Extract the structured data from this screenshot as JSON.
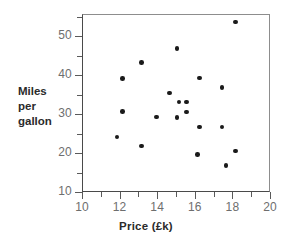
{
  "chart_data": {
    "type": "scatter",
    "title": "",
    "xlabel": "Price (£k)",
    "ylabel_lines": [
      "Miles",
      "per",
      "gallon"
    ],
    "ylabel": "Miles per gallon",
    "xlim": [
      10,
      20
    ],
    "ylim": [
      10,
      55
    ],
    "grid": false,
    "legend": null,
    "x_major_ticks": [
      10,
      12,
      14,
      16,
      18,
      20
    ],
    "x_minor_ticks": [
      11,
      13,
      15,
      17,
      19
    ],
    "x_tick_labels": [
      "10",
      "12",
      "14",
      "16",
      "18",
      "20"
    ],
    "y_major_ticks": [
      10,
      20,
      30,
      40,
      50
    ],
    "y_minor_ticks": [
      15,
      25,
      35,
      45
    ],
    "y_tick_labels": [
      "10",
      "20",
      "30",
      "40",
      "50"
    ],
    "marker": "filled-circle",
    "marker_color": "#1a1a1a",
    "points": [
      {
        "x": 11.8,
        "y": 24.4
      },
      {
        "x": 12.1,
        "y": 39.4
      },
      {
        "x": 12.1,
        "y": 30.9
      },
      {
        "x": 13.1,
        "y": 43.5
      },
      {
        "x": 13.1,
        "y": 22.1
      },
      {
        "x": 13.9,
        "y": 29.5
      },
      {
        "x": 14.6,
        "y": 35.6
      },
      {
        "x": 15.0,
        "y": 47.0
      },
      {
        "x": 15.0,
        "y": 29.4
      },
      {
        "x": 15.1,
        "y": 33.3
      },
      {
        "x": 15.5,
        "y": 33.3
      },
      {
        "x": 15.5,
        "y": 30.8
      },
      {
        "x": 16.1,
        "y": 19.8
      },
      {
        "x": 16.2,
        "y": 39.5
      },
      {
        "x": 16.2,
        "y": 26.9
      },
      {
        "x": 17.4,
        "y": 37.0
      },
      {
        "x": 17.4,
        "y": 26.9
      },
      {
        "x": 17.6,
        "y": 17.1
      },
      {
        "x": 18.1,
        "y": 53.8
      },
      {
        "x": 18.1,
        "y": 20.8
      }
    ]
  }
}
